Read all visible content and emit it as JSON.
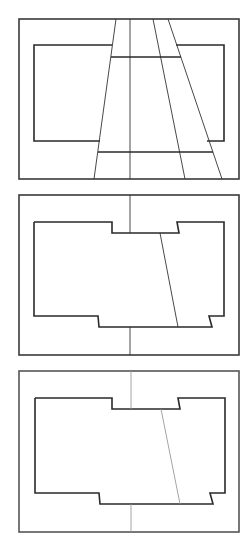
{
  "diagram": {
    "colors": {
      "background": "#ffffff",
      "stroke_dark": "#2a2a2a",
      "stroke_light": "#9a9a9a"
    },
    "panels": [
      {
        "id": "panel-1",
        "frame": {
          "x": 19,
          "y": 19,
          "w": 220,
          "h": 160
        },
        "inner_shape_left": "112,45 34,45 34,141 100,141",
        "inner_shape_right": "176,45 224,45 224,141 207,141",
        "lines": [
          {
            "x1": 116,
            "y1": 19,
            "x2": 94,
            "y2": 179
          },
          {
            "x1": 130,
            "y1": 19,
            "x2": 130,
            "y2": 179
          },
          {
            "x1": 153,
            "y1": 19,
            "x2": 185,
            "y2": 179
          },
          {
            "x1": 168,
            "y1": 19,
            "x2": 222,
            "y2": 179
          }
        ],
        "crossbars": [
          {
            "x1": 111,
            "y1": 57,
            "x2": 181,
            "y2": 57
          },
          {
            "x1": 98,
            "y1": 152,
            "x2": 213,
            "y2": 152
          }
        ]
      },
      {
        "id": "panel-2",
        "frame": {
          "x": 19,
          "y": 195,
          "w": 220,
          "h": 160
        },
        "inner_shape": "34,222 112,222 112,233 179,233 177,222 224,222 224,316 209,316 212,327 99,327 98,316 34,316 34,222",
        "lines": [
          {
            "x1": 130,
            "y1": 195,
            "x2": 130,
            "y2": 233
          },
          {
            "x1": 130,
            "y1": 327,
            "x2": 130,
            "y2": 355
          },
          {
            "x1": 160,
            "y1": 233,
            "x2": 178,
            "y2": 327
          }
        ]
      },
      {
        "id": "panel-3",
        "frame": {
          "x": 19,
          "y": 371,
          "w": 220,
          "h": 161
        },
        "inner_shape": "35,398 112,398 112,409 180,409 178,398 225,398 225,493 210,493 213,504 100,504 99,493 35,493 35,398",
        "lines": [
          {
            "x1": 131,
            "y1": 371,
            "x2": 131,
            "y2": 409
          },
          {
            "x1": 131,
            "y1": 504,
            "x2": 131,
            "y2": 532
          },
          {
            "x1": 161,
            "y1": 409,
            "x2": 180,
            "y2": 504
          }
        ],
        "line_style": "light"
      }
    ]
  }
}
